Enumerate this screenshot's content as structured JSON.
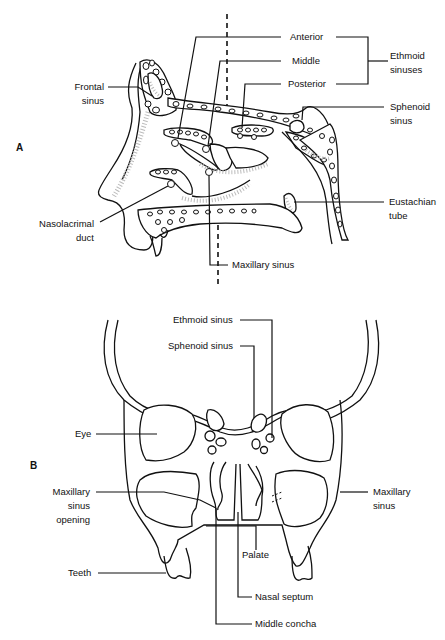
{
  "panels": {
    "a": {
      "letter": "A",
      "view": "sagittal",
      "labels": {
        "anterior": "Anterior",
        "middle": "Middle",
        "posterior": "Posterior",
        "ethmoid_sinuses_1": "Ethmoid",
        "ethmoid_sinuses_2": "sinuses",
        "frontal_sinus_1": "Frontal",
        "frontal_sinus_2": "sinus",
        "sphenoid_sinus_1": "Sphenoid",
        "sphenoid_sinus_2": "sinus",
        "nasolacrimal_duct_1": "Nasolacrimal",
        "nasolacrimal_duct_2": "duct",
        "eustachian_tube_1": "Eustachian",
        "eustachian_tube_2": "tube",
        "maxillary_sinus": "Maxillary sinus"
      }
    },
    "b": {
      "letter": "B",
      "view": "coronal",
      "labels": {
        "ethmoid_sinus": "Ethmoid sinus",
        "sphenoid_sinus": "Sphenoid sinus",
        "eye": "Eye",
        "maxillary_sinus_opening_1": "Maxillary",
        "maxillary_sinus_opening_2": "sinus",
        "maxillary_sinus_opening_3": "opening",
        "maxillary_sinus_1": "Maxillary",
        "maxillary_sinus_2": "sinus",
        "palate": "Palate",
        "teeth": "Teeth",
        "nasal_septum": "Nasal septum",
        "middle_concha": "Middle concha"
      }
    }
  }
}
